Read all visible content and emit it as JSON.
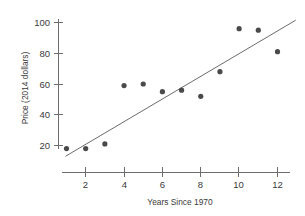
{
  "chart_data": {
    "type": "scatter",
    "title": "",
    "xlabel": "Years Since 1970",
    "ylabel": "Price (2014 dollars)",
    "xlim": [
      1,
      12.6
    ],
    "ylim": [
      14,
      103
    ],
    "grid": false,
    "legend": false,
    "x": [
      1,
      2,
      3,
      4,
      5,
      6,
      7,
      8,
      9,
      10,
      11,
      12
    ],
    "y": [
      18,
      18,
      21,
      59,
      60,
      55,
      56,
      52,
      68,
      96,
      95,
      81
    ],
    "points": [
      {
        "x": 1,
        "y": 18
      },
      {
        "x": 2,
        "y": 18
      },
      {
        "x": 3,
        "y": 21
      },
      {
        "x": 4,
        "y": 59
      },
      {
        "x": 5,
        "y": 60
      },
      {
        "x": 6,
        "y": 55
      },
      {
        "x": 7,
        "y": 56
      },
      {
        "x": 8,
        "y": 52
      },
      {
        "x": 9,
        "y": 68
      },
      {
        "x": 10,
        "y": 96
      },
      {
        "x": 11,
        "y": 95
      },
      {
        "x": 12,
        "y": 81
      }
    ],
    "trendline": {
      "name": "least-squares fit line",
      "x_start": 0.95,
      "y_start": 13.0,
      "x_end": 12.95,
      "y_end": 101.5
    },
    "xticks": [
      2,
      4,
      6,
      8,
      10,
      12
    ],
    "xtick_labels": [
      "2",
      "4",
      "6",
      "8",
      "10",
      "12"
    ],
    "yticks": [
      20,
      40,
      60,
      80,
      100
    ],
    "ytick_labels": [
      "20",
      "40",
      "60",
      "80",
      "100"
    ],
    "marker_color": "#4a4a4a",
    "line_color": "#5a5a5a",
    "axis_color": "#6d6d6d"
  }
}
